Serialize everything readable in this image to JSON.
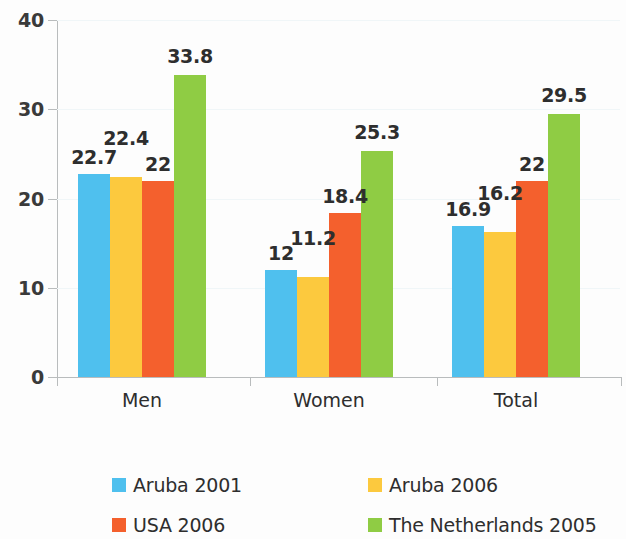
{
  "chart_data": {
    "type": "bar",
    "title": "",
    "subtitle": "",
    "xlabel": "",
    "ylabel": "",
    "categories": [
      "Men",
      "Women",
      "Total"
    ],
    "series": [
      {
        "name": "Aruba 2001",
        "color": "#4FC0EE",
        "values": [
          22.7,
          12,
          16.9
        ],
        "labels": [
          "22.7",
          "12",
          "16.9"
        ]
      },
      {
        "name": "Aruba 2006",
        "color": "#FCC93E",
        "values": [
          22.4,
          11.2,
          16.2
        ],
        "labels": [
          "22.4",
          "11.2",
          "16.2"
        ]
      },
      {
        "name": "USA 2006",
        "color": "#F4602D",
        "values": [
          22,
          18.4,
          22
        ],
        "labels": [
          "22",
          "18.4",
          "22"
        ]
      },
      {
        "name": "The Netherlands 2005",
        "color": "#8FCC44",
        "values": [
          33.8,
          25.3,
          29.5
        ],
        "labels": [
          "33.8",
          "25.3",
          "29.5"
        ]
      }
    ],
    "ylim": [
      0,
      40
    ],
    "y_ticks": [
      0,
      10,
      20,
      30,
      40
    ],
    "y_tick_labels": [
      "0",
      "10",
      "20",
      "30",
      "40"
    ],
    "grid": true,
    "legend_position": "bottom"
  },
  "legend": {
    "entries": [
      {
        "label": "Aruba 2001",
        "color": "#4FC0EE"
      },
      {
        "label": "Aruba 2006",
        "color": "#FCC93E"
      },
      {
        "label": "USA 2006",
        "color": "#F4602D"
      },
      {
        "label": "The Netherlands 2005",
        "color": "#8FCC44"
      }
    ]
  }
}
